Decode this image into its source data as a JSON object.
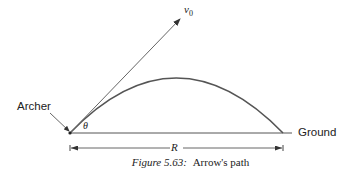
{
  "figure": {
    "caption_label": "Figure 5.63:",
    "caption_text": "Arrow's path"
  },
  "labels": {
    "archer": "Archer",
    "ground": "Ground",
    "velocity": "v",
    "velocity_subscript": "0",
    "angle": "θ",
    "range": "R"
  },
  "colors": {
    "trajectory": "#555555",
    "lines": "#444444",
    "text": "#222222"
  },
  "geometry": {
    "origin": [
      70,
      133
    ],
    "landing": [
      283,
      133
    ],
    "peak": [
      178,
      78
    ],
    "velocity_tip": [
      181,
      18
    ]
  }
}
